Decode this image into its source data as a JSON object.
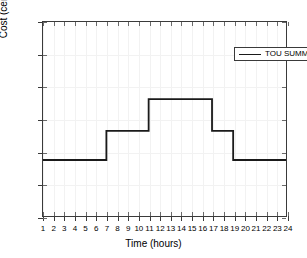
{
  "chart_data": {
    "type": "line",
    "subtype": "step",
    "title": "",
    "xlabel": "Time (hours)",
    "ylabel": "Cost (cents/kWh)",
    "xlim": [
      1,
      24
    ],
    "ylim": [
      0,
      30
    ],
    "xticks": [
      1,
      2,
      3,
      4,
      5,
      6,
      7,
      8,
      9,
      10,
      11,
      12,
      13,
      14,
      15,
      16,
      17,
      18,
      19,
      20,
      21,
      22,
      23,
      24
    ],
    "yticks": [
      0,
      5,
      10,
      15,
      20,
      25,
      30
    ],
    "grid": true,
    "legend_position": "top-right",
    "series": [
      {
        "name": "TOU SUMMER",
        "color": "#1a1a1a",
        "x": [
          1,
          2,
          3,
          4,
          5,
          6,
          7,
          8,
          9,
          10,
          11,
          12,
          13,
          14,
          15,
          16,
          17,
          18,
          19,
          20,
          21,
          22,
          23,
          24
        ],
        "values": [
          8.7,
          8.7,
          8.7,
          8.7,
          8.7,
          8.7,
          13.2,
          13.2,
          13.2,
          13.2,
          18.1,
          18.1,
          18.1,
          18.1,
          18.1,
          18.1,
          13.2,
          13.2,
          8.7,
          8.7,
          8.7,
          8.7,
          8.7,
          8.7
        ],
        "steps": [
          {
            "from_hour": 1,
            "to_hour": 7,
            "value": 8.7
          },
          {
            "from_hour": 7,
            "to_hour": 11,
            "value": 13.2
          },
          {
            "from_hour": 11,
            "to_hour": 17,
            "value": 18.1
          },
          {
            "from_hour": 17,
            "to_hour": 19,
            "value": 13.2
          },
          {
            "from_hour": 19,
            "to_hour": 24,
            "value": 8.7
          }
        ]
      }
    ]
  },
  "legend": {
    "entries": [
      {
        "label": "TOU SUMMER"
      }
    ]
  },
  "axes": {
    "y_title": "Cost (cents/kWh)",
    "x_title": "Time (hours)"
  }
}
